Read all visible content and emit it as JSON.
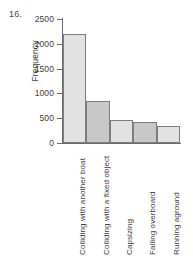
{
  "problem": {
    "number": "16."
  },
  "chart_data": {
    "type": "bar",
    "title": "",
    "xlabel": "",
    "ylabel": "Frequency",
    "ylim": [
      0,
      2500
    ],
    "yticks": [
      0,
      500,
      1000,
      1500,
      2000,
      2500
    ],
    "ytick_labels": [
      "0",
      "500",
      "1000",
      "1500",
      "2000",
      "2500"
    ],
    "grid": false,
    "legend": "none",
    "categories": [
      "Colliding with another boat",
      "Colliding with a fixed object",
      "Capsizing",
      "Falling overboard",
      "Running aground"
    ],
    "values": [
      2200,
      840,
      460,
      430,
      345
    ],
    "bar_colors": [
      "#e2e2e2",
      "#c8c8c8",
      "#e2e2e2",
      "#c8c8c8",
      "#e2e2e2"
    ],
    "bar_edge_color": "#7d7d7d",
    "axis_color": "#6b6b6b",
    "text_color": "#3d3d3d"
  }
}
